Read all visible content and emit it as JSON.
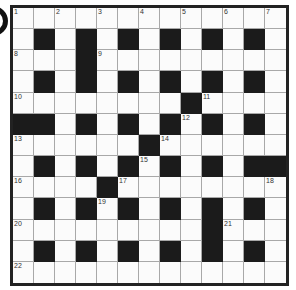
{
  "puzzle": {
    "type": "crossword",
    "size": {
      "rows": 13,
      "cols": 13
    },
    "colors": {
      "black": "#1b1b1b",
      "white": "#fbfbfb",
      "gridline": "#a8a8a8",
      "border": "#222222"
    },
    "layout": [
      ".............",
      ".#.#.#.#.#.#.",
      "...#.........",
      ".#.#.#.#.#.#.",
      "........#....",
      "##.#.#.#.#.#.",
      "......#......",
      ".#.#.#.#.#.##",
      "....#........",
      ".#.#.#.#.#.#.",
      ".........#...",
      ".#.#.#.#.#.#.",
      "............."
    ],
    "numbers": [
      {
        "n": "1",
        "r": 0,
        "c": 0
      },
      {
        "n": "2",
        "r": 0,
        "c": 2
      },
      {
        "n": "3",
        "r": 0,
        "c": 4
      },
      {
        "n": "4",
        "r": 0,
        "c": 6
      },
      {
        "n": "5",
        "r": 0,
        "c": 8
      },
      {
        "n": "6",
        "r": 0,
        "c": 10
      },
      {
        "n": "7",
        "r": 0,
        "c": 12
      },
      {
        "n": "8",
        "r": 2,
        "c": 0
      },
      {
        "n": "9",
        "r": 2,
        "c": 4
      },
      {
        "n": "10",
        "r": 4,
        "c": 0
      },
      {
        "n": "11",
        "r": 4,
        "c": 9
      },
      {
        "n": "12",
        "r": 5,
        "c": 8
      },
      {
        "n": "13",
        "r": 6,
        "c": 0
      },
      {
        "n": "14",
        "r": 6,
        "c": 7
      },
      {
        "n": "15",
        "r": 7,
        "c": 6
      },
      {
        "n": "16",
        "r": 8,
        "c": 0
      },
      {
        "n": "17",
        "r": 8,
        "c": 5
      },
      {
        "n": "18",
        "r": 8,
        "c": 12
      },
      {
        "n": "19",
        "r": 9,
        "c": 4
      },
      {
        "n": "20",
        "r": 10,
        "c": 0
      },
      {
        "n": "21",
        "r": 10,
        "c": 10
      },
      {
        "n": "22",
        "r": 12,
        "c": 0
      }
    ]
  }
}
